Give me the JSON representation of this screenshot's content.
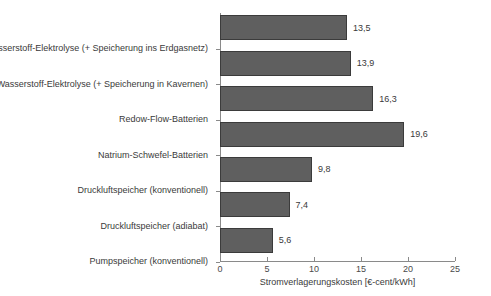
{
  "chart_data": {
    "type": "bar",
    "orientation": "horizontal",
    "title": "",
    "xlabel": "Stromverlagerungskosten [€-cent/kWh]",
    "ylabel": "",
    "xlim": [
      0,
      25
    ],
    "xticks": [
      0,
      5,
      10,
      15,
      20,
      25
    ],
    "xticklabels": [
      "0",
      "5",
      "10",
      "15",
      "20",
      "25"
    ],
    "grid": false,
    "legend": null,
    "decimal_separator": ",",
    "bar_color": "#5f5f5f",
    "bar_edge_color": "#3b3b3b",
    "axis_color": "#8a8a8a",
    "text_color": "#3a3a3a",
    "categories": [
      "Wasserstoff-Elektrolyse (+ Speicherung ins Erdgasnetz)",
      "Wasserstoff-Elektrolyse (+ Speicherung in Kavernen)",
      "Redow-Flow-Batterien",
      "Natrium-Schwefel-Batterien",
      "Druckluftspeicher (konventionell)",
      "Druckluftspeicher (adiabat)",
      "Pumpspeicher (konventionell)"
    ],
    "values": [
      13.5,
      13.9,
      16.3,
      19.6,
      9.8,
      7.4,
      5.6
    ],
    "value_labels": [
      "13,5",
      "13,9",
      "16,3",
      "19,6",
      "9,8",
      "7,4",
      "5,6"
    ]
  }
}
